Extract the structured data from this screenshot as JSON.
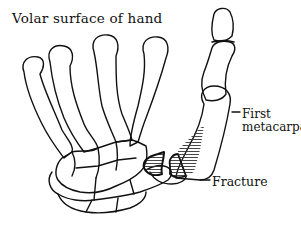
{
  "diagram": {
    "title": "Volar surface of hand",
    "labels": {
      "first_metacarpal_line1": "First",
      "first_metacarpal_line2": "metacarpal",
      "fracture": "Fracture"
    },
    "colors": {
      "outline": "#111111",
      "fracture_fill": "#9a9a9a",
      "background": "#ffffff"
    }
  }
}
